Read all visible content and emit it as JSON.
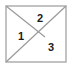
{
  "figure": {
    "type": "geometric-diagram",
    "canvas": {
      "width": 74,
      "height": 72,
      "background": "#ffffff"
    },
    "square": {
      "x1": 6,
      "y1": 6,
      "x2": 66,
      "y2": 62,
      "stroke": "#a9a9a9",
      "stroke_width": 1.4,
      "fill": "#ffffff"
    },
    "lines": [
      {
        "name": "diagonal-top-left-to-center",
        "from": {
          "x": 6,
          "y": 6
        },
        "to": {
          "x": 45,
          "y": 37
        },
        "stroke": "#9a9a9a",
        "stroke_width": 1.2
      },
      {
        "name": "diagonal-bottom-left-to-top-right",
        "from": {
          "x": 6,
          "y": 62
        },
        "to": {
          "x": 66,
          "y": 6
        },
        "stroke": "#9a9a9a",
        "stroke_width": 1.2
      }
    ],
    "labels": [
      {
        "text": "1",
        "x": 21,
        "y": 37,
        "region": "left-triangle"
      },
      {
        "text": "2",
        "x": 40,
        "y": 19,
        "region": "top-triangle"
      },
      {
        "text": "3",
        "x": 51,
        "y": 48,
        "region": "bottom-right-triangle"
      }
    ],
    "label_color": "#1a1a1a"
  }
}
